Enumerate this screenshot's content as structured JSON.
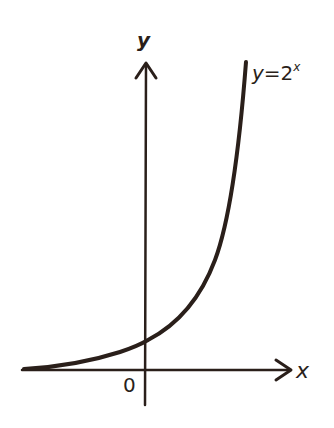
{
  "figure": {
    "y_axis_label": "y",
    "x_axis_label": "x",
    "origin_label": "0",
    "curve_label_lhs": "y",
    "curve_label_eq": "=",
    "curve_label_base": "2",
    "curve_label_exp": "x",
    "ink_color": "#2a1f1a",
    "background": "#ffffff"
  }
}
